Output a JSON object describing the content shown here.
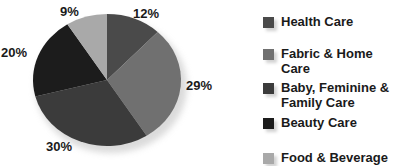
{
  "chart_data": {
    "type": "pie",
    "title": "",
    "categories": [
      "Health Care",
      "Fabric & Home Care",
      "Baby, Feminine & Family Care",
      "Beauty Care",
      "Food & Beverage"
    ],
    "values": [
      12,
      29,
      30,
      20,
      9
    ],
    "labels": [
      "12%",
      "29%",
      "30%",
      "20%",
      "9%"
    ],
    "colors": [
      "#4a4a4a",
      "#707070",
      "#3b3b3b",
      "#1c1c1c",
      "#a9a9a9"
    ],
    "start_angle": "12 o'clock",
    "direction": "clockwise",
    "legend_position": "right"
  },
  "legend": {
    "items": [
      {
        "label_line1": "Health Care",
        "label_line2": "",
        "color": "#4a4a4a"
      },
      {
        "label_line1": "Fabric & Home",
        "label_line2": "Care",
        "color": "#707070"
      },
      {
        "label_line1": "Baby, Feminine &",
        "label_line2": "Family Care",
        "color": "#3b3b3b"
      },
      {
        "label_line1": "Beauty Care",
        "label_line2": "",
        "color": "#1c1c1c"
      },
      {
        "label_line1": "Food & Beverage",
        "label_line2": "",
        "color": "#a9a9a9"
      }
    ]
  },
  "slice_labels": {
    "health_care": "12%",
    "fabric_home": "29%",
    "baby_family": "30%",
    "beauty": "20%",
    "food_beverage": "9%"
  }
}
